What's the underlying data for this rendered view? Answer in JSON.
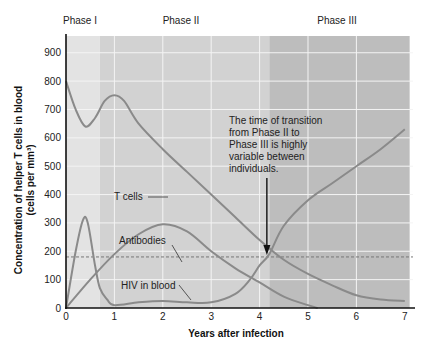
{
  "chart_data": {
    "type": "line",
    "title": "",
    "xlabel": "Years after infection",
    "ylabel": "Concentration of helper T cells in blood (cells per mm³)",
    "ylabel_line1": "Concentration of helper T cells in blood",
    "ylabel_line2": "(cells per mm³)",
    "xlim": [
      0,
      7
    ],
    "ylim": [
      0,
      950
    ],
    "x_ticks": [
      0,
      1,
      2,
      3,
      4,
      5,
      6,
      7
    ],
    "y_ticks": [
      0,
      100,
      200,
      300,
      400,
      500,
      600,
      700,
      800,
      900
    ],
    "grid": true,
    "phases": [
      {
        "label": "Phase I",
        "start": 0,
        "end": 0.7,
        "color": "#e3e3e3"
      },
      {
        "label": "Phase II",
        "start": 0.7,
        "end": 4.2,
        "color": "#d2d2d2"
      },
      {
        "label": "Phase III",
        "start": 4.2,
        "end": 7.1,
        "color": "#bdbdbd"
      }
    ],
    "threshold_line": {
      "value": 180,
      "style": "dashed"
    },
    "series": [
      {
        "name": "T cells",
        "x": [
          0,
          0.2,
          0.4,
          0.6,
          0.8,
          1,
          1.2,
          1.5,
          2,
          2.5,
          3,
          3.5,
          4,
          4.5,
          5,
          5.5,
          6,
          6.5,
          7
        ],
        "values": [
          800,
          700,
          640,
          670,
          730,
          750,
          730,
          650,
          560,
          480,
          400,
          320,
          240,
          170,
          120,
          80,
          45,
          30,
          25
        ]
      },
      {
        "name": "Antibodies",
        "x": [
          0,
          0.5,
          1,
          1.5,
          2,
          2.5,
          3,
          3.5,
          4,
          4.5,
          5,
          5.2
        ],
        "values": [
          0,
          100,
          190,
          260,
          295,
          270,
          200,
          140,
          90,
          40,
          10,
          0
        ]
      },
      {
        "name": "HIV in blood",
        "x": [
          0,
          0.2,
          0.35,
          0.45,
          0.6,
          0.7,
          0.85,
          1,
          1.5,
          2,
          2.5,
          3,
          3.5,
          3.8,
          4,
          4.2,
          4.5,
          5,
          5.5,
          6,
          6.5,
          7
        ],
        "values": [
          0,
          200,
          310,
          300,
          150,
          70,
          30,
          10,
          20,
          25,
          20,
          20,
          50,
          100,
          150,
          190,
          290,
          380,
          440,
          500,
          560,
          630
        ]
      }
    ],
    "annotations": [
      {
        "text": "The time of transition from Phase II to Phase III is highly variable between individuals.",
        "lines": [
          "The time of transition",
          "from Phase II to",
          "Phase III is highly",
          "variable between",
          "individuals."
        ],
        "arrow_to": [
          4.15,
          180
        ]
      }
    ],
    "series_labels": {
      "t_cells": "T cells",
      "antibodies": "Antibodies",
      "hiv": "HIV in blood"
    },
    "colors": {
      "curve": "#8a8a8a",
      "axis": "#111111",
      "grid": "#f4f4f4",
      "arrow": "#111111",
      "dashed": "#777777"
    }
  }
}
